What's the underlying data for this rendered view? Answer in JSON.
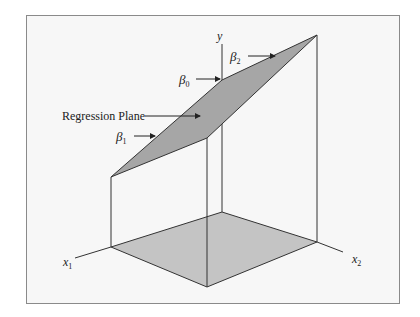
{
  "diagram": {
    "axes": {
      "y": "y",
      "x1": {
        "base": "x",
        "sub": "1"
      },
      "x2": {
        "base": "x",
        "sub": "2"
      }
    },
    "annotations": {
      "plane": "Regression Plane",
      "beta0": {
        "base": "β",
        "sub": "0"
      },
      "beta1": {
        "base": "β",
        "sub": "1"
      },
      "beta2": {
        "base": "β",
        "sub": "2"
      }
    },
    "colors": {
      "plane_fill": "#a6a6a6",
      "base_fill": "#c4c4c4",
      "line": "#333333",
      "background": "#f7f7f7",
      "frame": "#8a8a8a"
    }
  }
}
